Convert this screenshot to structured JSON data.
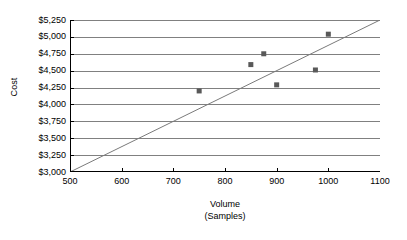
{
  "chart_data": {
    "type": "scatter",
    "title": "",
    "xlabel": "Volume (Samples)",
    "xlabel_lines": [
      "Volume",
      "(Samples)"
    ],
    "ylabel": "Cost",
    "xlim": [
      500,
      1100
    ],
    "ylim": [
      3000,
      5250
    ],
    "xticks": [
      500,
      600,
      700,
      800,
      900,
      1000,
      1100
    ],
    "xtick_labels": [
      "500",
      "600",
      "700",
      "800",
      "900",
      "1000",
      "1100"
    ],
    "yticks": [
      3000,
      3250,
      3500,
      3750,
      4000,
      4250,
      4500,
      4750,
      5000,
      5250
    ],
    "ytick_labels": [
      "$3,000",
      "$3,250",
      "$3,500",
      "$3,750",
      "$4,000",
      "$4,250",
      "$4,500",
      "$4,750",
      "$5,000",
      "$5,250"
    ],
    "grid": "horizontal",
    "legend": "none",
    "series": [
      {
        "name": "Cost observations",
        "type": "scatter",
        "marker": "square",
        "color": "#595959",
        "points": [
          {
            "x": 750,
            "y": 4200
          },
          {
            "x": 850,
            "y": 4590
          },
          {
            "x": 875,
            "y": 4750
          },
          {
            "x": 900,
            "y": 4290
          },
          {
            "x": 975,
            "y": 4510
          },
          {
            "x": 1000,
            "y": 5040
          }
        ]
      },
      {
        "name": "Reference line",
        "type": "line",
        "color": "#7a7a7a",
        "points": [
          {
            "x": 500,
            "y": 3000
          },
          {
            "x": 1100,
            "y": 5250
          }
        ]
      }
    ]
  },
  "colors": {
    "axis": "#000000",
    "gridline": "#808080",
    "marker": "#595959",
    "trendline": "#7a7a7a",
    "background": "#ffffff"
  }
}
